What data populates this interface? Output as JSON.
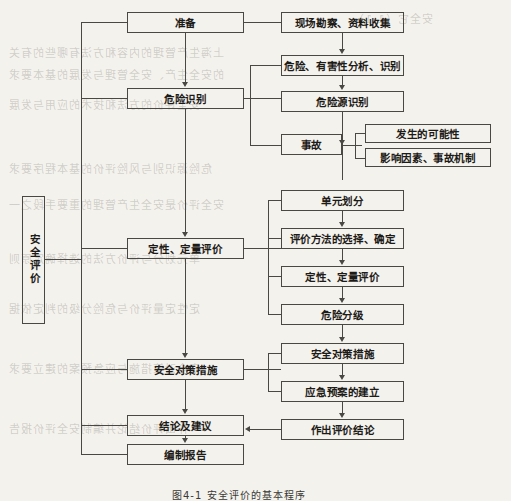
{
  "diagram": {
    "title_caption": "图4-1  安全评价的基本程序",
    "root": {
      "label": "安全评价",
      "orientation": "vertical"
    },
    "main_stages": [
      {
        "id": "prepare",
        "label": "准备"
      },
      {
        "id": "hazard-id",
        "label": "危险识别"
      },
      {
        "id": "qual-quant-eval",
        "label": "定性、定量评价"
      },
      {
        "id": "safety-measures",
        "label": "安全对策措施"
      },
      {
        "id": "conclusion-advice",
        "label": "结论及建议"
      },
      {
        "id": "compile-report",
        "label": "编制报告"
      }
    ],
    "detail_steps": [
      {
        "id": "site-survey",
        "label": "现场勘察、资料收集"
      },
      {
        "id": "hazard-analysis",
        "label": "危险、有害性分析、识别"
      },
      {
        "id": "hazard-source-id",
        "label": "危险源识别"
      },
      {
        "id": "accident",
        "label": "事故"
      },
      {
        "id": "unit-division",
        "label": "单元划分"
      },
      {
        "id": "method-selection",
        "label": "评价方法的选择、确定"
      },
      {
        "id": "qual-quant-detail",
        "label": "定性、定量评价"
      },
      {
        "id": "hazard-grading",
        "label": "危险分级"
      },
      {
        "id": "safety-measures-detail",
        "label": "安全对策措施"
      },
      {
        "id": "emergency-plan",
        "label": "应急预案的建立"
      },
      {
        "id": "make-conclusion",
        "label": "作出评价结论"
      }
    ],
    "accident_sub_steps": [
      {
        "id": "occurrence-probability",
        "label": "发生的可能性"
      },
      {
        "id": "influencing-factors",
        "label": "影响因素、事故机制"
      }
    ],
    "colors": {
      "line": "#4a4843",
      "text": "#1d1b18",
      "page_background": "#f4f2ed"
    }
  },
  "ghost_text": {
    "lines": [
      "安全它（1.1）",
      "上海生产管理的内容和方法有哪些的有关",
      "的安全生产、安全管理与发展的基本要求",
      "安全评价的方法和技术的应用与发展",
      "危险源识别与风险评价的基本程序要求",
      "安全评价是安全生产管理的重要手段之一",
      "单元划分与评价方法的选择确定原则",
      "定性定量评价与危险分级的判定依据",
      "安全对策措施与应急预案的建立要求",
      "作出评价结论并编制安全评价报告"
    ]
  }
}
